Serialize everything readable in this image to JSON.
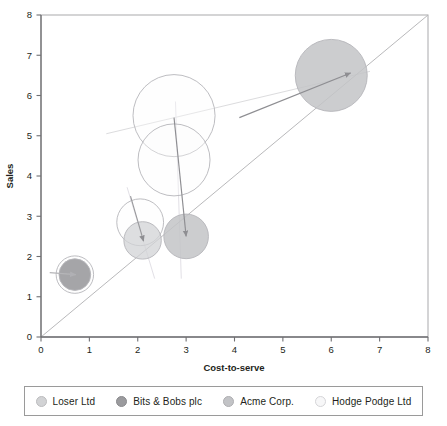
{
  "chart_data": {
    "type": "scatter",
    "title": "",
    "xlabel": "Cost-to-serve",
    "ylabel": "Sales",
    "xlim": [
      0,
      8
    ],
    "ylim": [
      0,
      8
    ],
    "xticks": [
      "0",
      "1",
      "2",
      "3",
      "4",
      "5",
      "6",
      "7",
      "8"
    ],
    "yticks": [
      "0",
      "1",
      "2",
      "3",
      "4",
      "5",
      "6",
      "7",
      "8"
    ],
    "grid": false,
    "legend_position": "bottom",
    "reference_line": {
      "name": "parity-line",
      "from": [
        0,
        0
      ],
      "to": [
        8,
        8
      ],
      "color": "#b9b9bb"
    },
    "series": [
      {
        "name": "Loser Ltd",
        "color": "#d2d3d5",
        "fill_opacity": 0.75,
        "points": [
          {
            "x": 2.1,
            "y": 2.4,
            "size": 0.52,
            "label": "Loser Ltd"
          }
        ]
      },
      {
        "name": "Bits & Bobs plc",
        "color": "#a0a0a3",
        "fill_opacity": 0.95,
        "points": [
          {
            "x": 0.7,
            "y": 1.55,
            "size": 0.44,
            "label": "Bits & Bobs plc"
          }
        ]
      },
      {
        "name": "Acme Corp.",
        "color": "#c3c4c7",
        "fill_opacity": 0.85,
        "points": [
          {
            "x": 3.0,
            "y": 2.5,
            "size": 0.62,
            "label": "Acme Corp."
          },
          {
            "x": 6.0,
            "y": 6.5,
            "size": 1.0,
            "label": "Acme Corp."
          }
        ]
      },
      {
        "name": "Hodge Podge Ltd",
        "color": "#fbfbfc",
        "fill_opacity": 0.35,
        "points": [
          {
            "x": 2.75,
            "y": 5.5,
            "size": 1.14,
            "label": "Hodge Podge Ltd"
          },
          {
            "x": 2.75,
            "y": 4.4,
            "size": 1.0,
            "label": "Hodge Podge Ltd"
          },
          {
            "x": 2.05,
            "y": 2.85,
            "size": 0.65,
            "label": "Hodge Podge Ltd"
          },
          {
            "x": 0.7,
            "y": 1.55,
            "size": 0.52,
            "label": "Hodge Podge Ltd"
          }
        ]
      }
    ],
    "vectors": [
      {
        "name": "acme-large-vector",
        "from": [
          4.1,
          5.45
        ],
        "to": [
          6.4,
          6.56
        ],
        "color": "#8e8e92"
      },
      {
        "name": "acme-small-vector",
        "from": [
          2.75,
          5.45
        ],
        "to": [
          3.0,
          2.5
        ],
        "color": "#8e8e92"
      },
      {
        "name": "loser-vector",
        "from": [
          1.85,
          3.5
        ],
        "to": [
          2.12,
          2.38
        ],
        "color": "#9a9a9d"
      },
      {
        "name": "bits-vector",
        "from": [
          0.18,
          1.6
        ],
        "to": [
          0.72,
          1.55
        ],
        "color": "#b5b5b8"
      }
    ],
    "trend_lines": [
      {
        "name": "upper-trend",
        "from": [
          1.35,
          5.05
        ],
        "to": [
          6.8,
          6.6
        ],
        "color": "#dcdcde"
      },
      {
        "name": "acme-axis-guide",
        "from": [
          2.78,
          5.85
        ],
        "to": [
          2.9,
          1.45
        ],
        "color": "#e2e0e6"
      },
      {
        "name": "loser-axis-guide",
        "from": [
          1.78,
          3.72
        ],
        "to": [
          2.35,
          1.45
        ],
        "color": "#e2e0e6"
      }
    ]
  },
  "legend": {
    "items": [
      {
        "label": "Loser Ltd",
        "color": "#d2d3d5",
        "border": "#bcbcbe"
      },
      {
        "label": "Bits & Bobs plc",
        "color": "#9b9b9e",
        "border": "#8a8a8d"
      },
      {
        "label": "Acme Corp.",
        "color": "#c2c3c6",
        "border": "#aeaeb1",
        "_dup": ""
      },
      {
        "label": "Hodge Podge Ltd",
        "color": "#f7f7f8",
        "border": "#d5d5d8"
      }
    ]
  },
  "axes": {
    "x_label": "Cost-to-serve",
    "y_label": "Sales",
    "axis_color": "#6f6f72",
    "tick_color": "#6f6f72",
    "frame_color": "#a9a9ac"
  }
}
